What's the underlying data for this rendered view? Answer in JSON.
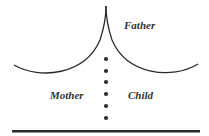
{
  "labels": {
    "father": "Father",
    "mother": "Mother",
    "child": "Child"
  },
  "colors": {
    "line": "#2b2b2b",
    "text": "#333333",
    "background": "#ffffff"
  },
  "dots": {
    "count": 6,
    "x": 106,
    "y": [
      59,
      71,
      82,
      94,
      106,
      118
    ]
  }
}
